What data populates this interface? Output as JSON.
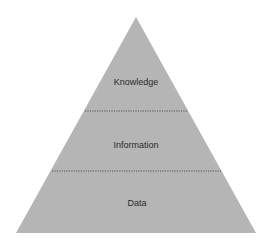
{
  "diagram": {
    "type": "pyramid",
    "fill_color": "#b5b5b5",
    "divider_color": "#4a4a4a",
    "text_color": "#2b2b2b",
    "tiers": [
      {
        "label": "Knowledge",
        "position": "top"
      },
      {
        "label": "Information",
        "position": "middle"
      },
      {
        "label": "Data",
        "position": "bottom"
      }
    ]
  }
}
